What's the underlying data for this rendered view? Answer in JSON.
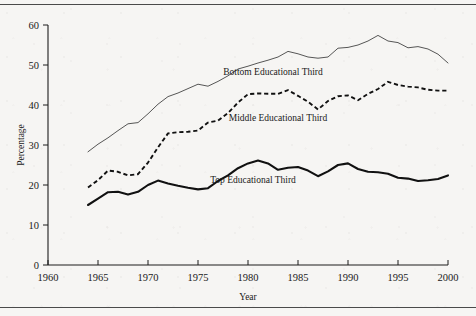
{
  "figure": {
    "background_color": "#f6f5f3",
    "rule_color": "#4a4a4a"
  },
  "axes": {
    "y_title": "Percentage",
    "x_title": "Year",
    "y_ticks": [
      "0",
      "10",
      "20",
      "30",
      "40",
      "50",
      "60"
    ],
    "x_ticks": [
      "1960",
      "1965",
      "1970",
      "1975",
      "1980",
      "1985",
      "1990",
      "1995",
      "2000"
    ]
  },
  "labels": {
    "bottom": "Bottom Educational Third",
    "middle": "Middle Educational Third",
    "top": "Top Educational Third"
  },
  "colors": {
    "top_line": "#111111",
    "middle_line": "#111111",
    "bottom_line": "#4d4d4d",
    "axis": "#1c1c1c"
  },
  "chart_data": {
    "type": "line",
    "title": "",
    "xlabel": "Year",
    "ylabel": "Percentage",
    "xlim": [
      1960,
      2000
    ],
    "ylim": [
      0,
      60
    ],
    "xticks": [
      1960,
      1965,
      1970,
      1975,
      1980,
      1985,
      1990,
      1995,
      2000
    ],
    "yticks": [
      0,
      10,
      20,
      30,
      40,
      50,
      60
    ],
    "grid": false,
    "legend": "inline-annotations",
    "x": [
      1964,
      1965,
      1966,
      1967,
      1968,
      1969,
      1970,
      1971,
      1972,
      1973,
      1974,
      1975,
      1976,
      1977,
      1978,
      1979,
      1980,
      1981,
      1982,
      1983,
      1984,
      1985,
      1986,
      1987,
      1988,
      1989,
      1990,
      1991,
      1992,
      1993,
      1994,
      1995,
      1996,
      1997,
      1998,
      1999,
      2000
    ],
    "series": [
      {
        "name": "Bottom Educational Third",
        "style": "thin-solid",
        "values": [
          28.3,
          30.2,
          31.8,
          33.6,
          35.3,
          35.6,
          37.8,
          40.2,
          42.1,
          43.0,
          44.1,
          45.2,
          44.7,
          45.9,
          47.3,
          49.0,
          49.7,
          50.5,
          51.2,
          52.0,
          53.4,
          52.8,
          52.0,
          51.7,
          52.0,
          54.2,
          54.4,
          55.0,
          56.0,
          57.4,
          56.0,
          55.6,
          54.3,
          54.6,
          54.0,
          52.7,
          50.5
        ]
      },
      {
        "name": "Middle Educational Third",
        "style": "dashed",
        "values": [
          19.4,
          21.2,
          23.6,
          23.3,
          22.4,
          22.7,
          25.6,
          29.4,
          32.9,
          33.2,
          33.3,
          33.6,
          35.6,
          36.1,
          38.0,
          40.6,
          42.7,
          42.9,
          42.8,
          42.8,
          43.7,
          42.3,
          40.8,
          38.9,
          41.0,
          42.2,
          42.4,
          41.2,
          42.8,
          44.0,
          45.8,
          45.0,
          44.6,
          44.4,
          43.8,
          43.6,
          43.6
        ]
      },
      {
        "name": "Top Educational Third",
        "style": "thick-solid",
        "values": [
          15.0,
          16.6,
          18.2,
          18.3,
          17.6,
          18.3,
          20.0,
          21.1,
          20.4,
          19.8,
          19.3,
          18.9,
          19.2,
          21.0,
          22.4,
          24.2,
          25.4,
          26.1,
          25.4,
          23.8,
          24.3,
          24.5,
          23.6,
          22.2,
          23.4,
          25.0,
          25.4,
          24.0,
          23.3,
          23.2,
          22.8,
          21.8,
          21.6,
          21.0,
          21.2,
          21.5,
          22.4
        ]
      }
    ],
    "annotations": [
      {
        "text": "Bottom Educational Third",
        "x": 1982.5,
        "y": 47.5
      },
      {
        "text": "Middle Educational Third",
        "x": 1983.0,
        "y": 36.0
      },
      {
        "text": "Top Educational Third",
        "x": 1980.5,
        "y": 20.5
      }
    ]
  }
}
